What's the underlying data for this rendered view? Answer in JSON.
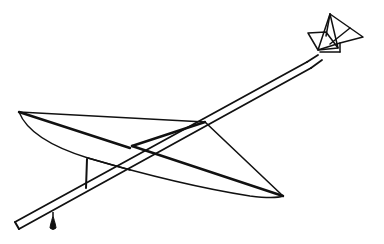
{
  "figure": {
    "background": "#ffffff",
    "stroke": "#111111",
    "parts": [
      "wing",
      "fuselage-boom",
      "wing-strut",
      "nose-propeller",
      "ballast-weight"
    ]
  }
}
